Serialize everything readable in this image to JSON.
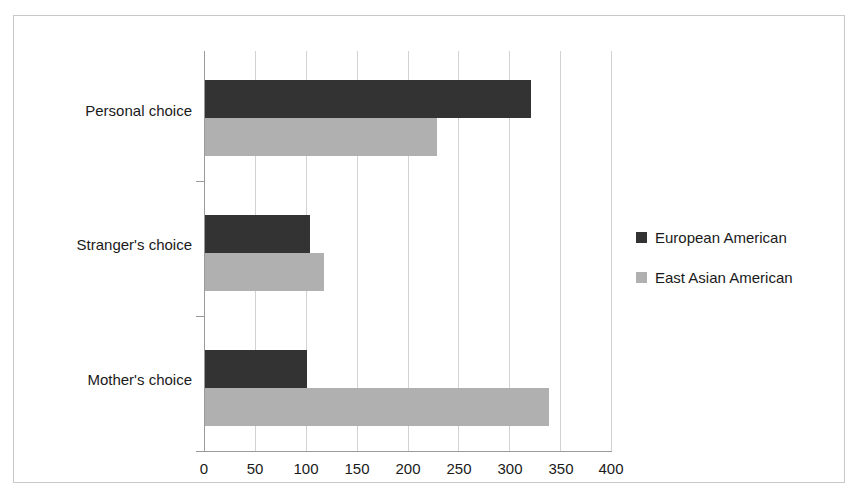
{
  "chart_data": {
    "type": "bar",
    "orientation": "horizontal",
    "title": "",
    "xlabel": "",
    "ylabel": "",
    "categories": [
      "Personal choice",
      "Stranger's choice",
      "Mother's choice"
    ],
    "series": [
      {
        "name": "European American",
        "color": "#333333",
        "values": [
          320,
          103,
          100
        ]
      },
      {
        "name": "East Asian American",
        "color": "#b0b0b0",
        "values": [
          228,
          117,
          337
        ]
      }
    ],
    "xlim": [
      0,
      400
    ],
    "xticks": [
      0,
      50,
      100,
      150,
      200,
      250,
      300,
      350,
      400
    ],
    "xtick_labels": [
      "0",
      "50",
      "100",
      "150",
      "200",
      "250",
      "300",
      "350",
      "400"
    ],
    "grid": "vertical",
    "legend_position": "right"
  },
  "legend": {
    "entries": [
      {
        "label": "European American",
        "color": "#333333"
      },
      {
        "label": "East Asian American",
        "color": "#b0b0b0"
      }
    ]
  },
  "axis": {
    "tick_labels": [
      "0",
      "50",
      "100",
      "150",
      "200",
      "250",
      "300",
      "350",
      "400"
    ]
  },
  "categories": [
    "Personal choice",
    "Stranger's choice",
    "Mother's choice"
  ]
}
